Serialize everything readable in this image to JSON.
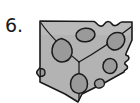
{
  "page": {
    "background_color": "#ffffff",
    "width": 140,
    "height": 103
  },
  "item": {
    "number_label": "6.",
    "number_color": "#1a1a1a"
  },
  "figure": {
    "name": "cheese-wedge",
    "body_fill": "#b3b3b3",
    "body_highlight_fill": "#c4c4c4",
    "hole_fill": "#9a9a9a",
    "outline_color": "#1a1a1a",
    "outline_width": "1.6",
    "crease_color": "#1a1a1a",
    "crease_width": "1.2",
    "holes": [
      {
        "name": "hole-top-left-heart",
        "shape": "heart",
        "cx": 28,
        "cy": 42
      },
      {
        "name": "hole-top-center-oval",
        "shape": "oval",
        "cx": 51,
        "cy": 25
      },
      {
        "name": "hole-top-right-heart",
        "shape": "heart",
        "cx": 79,
        "cy": 31
      },
      {
        "name": "hole-mid-right-oval",
        "shape": "oval",
        "cx": 76,
        "cy": 56
      },
      {
        "name": "hole-bottom-center-heart",
        "shape": "heart",
        "cx": 46,
        "cy": 73
      },
      {
        "name": "hole-bottom-right-small",
        "shape": "oval",
        "cx": 66,
        "cy": 74
      },
      {
        "name": "hole-left-edge-notch",
        "shape": "notch",
        "cx": 8,
        "cy": 62
      }
    ],
    "creases": [
      {
        "name": "crease-left-upper",
        "from": "top-left-corner",
        "to": "center"
      },
      {
        "name": "crease-right-upper",
        "from": "right-edge",
        "to": "center"
      },
      {
        "name": "crease-bottom-vertical",
        "from": "center",
        "to": "bottom-edge"
      }
    ]
  }
}
